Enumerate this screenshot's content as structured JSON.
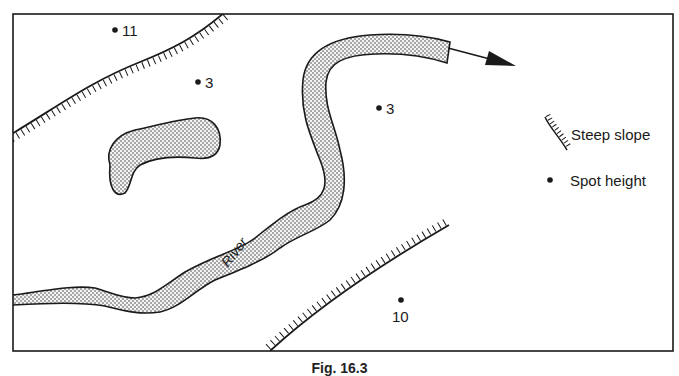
{
  "figure": {
    "caption": "Fig. 16.3"
  },
  "map": {
    "river_label": "River",
    "spot_heights": [
      {
        "value": "11",
        "x": 115,
        "y": 30
      },
      {
        "value": "3",
        "x": 198,
        "y": 82
      },
      {
        "value": "3",
        "x": 379,
        "y": 108
      },
      {
        "value": "10",
        "x": 401,
        "y": 300
      }
    ]
  },
  "legend": {
    "items": [
      {
        "symbol": "steep-slope",
        "label": "Steep slope"
      },
      {
        "symbol": "spot-height",
        "label": "Spot height"
      }
    ]
  },
  "colors": {
    "ink": "#1a1a1a",
    "river_fill": "#d9d9d9",
    "background": "#ffffff"
  }
}
